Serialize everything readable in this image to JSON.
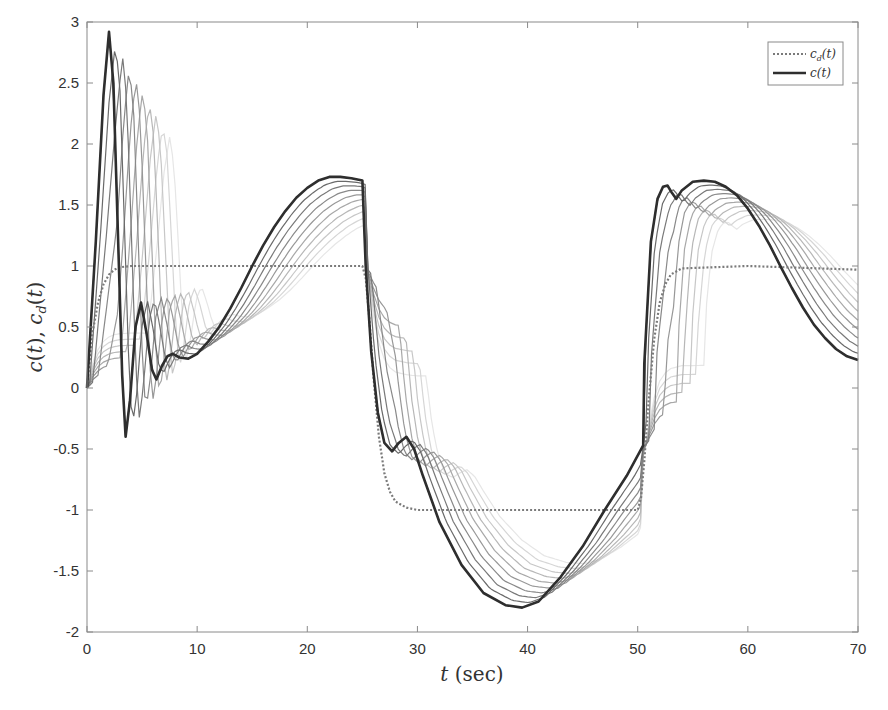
{
  "chart_data": {
    "type": "line",
    "title": "",
    "xlabel": "t (sec)",
    "ylabel": "c(t), c_d(t)",
    "xlim": [
      0,
      70
    ],
    "ylim": [
      -2,
      3
    ],
    "xticks": [
      0,
      10,
      20,
      30,
      40,
      50,
      60,
      70
    ],
    "xtick_labels": [
      "0",
      "10",
      "20",
      "30",
      "40",
      "50",
      "60",
      "70"
    ],
    "yticks": [
      -2,
      -1.5,
      -1,
      -0.5,
      0,
      0.5,
      1,
      1.5,
      2,
      2.5,
      3
    ],
    "ytick_labels": [
      "-2",
      "-1.5",
      "-1",
      "-0.5",
      "0",
      "0.5",
      "1",
      "1.5",
      "2",
      "2.5",
      "3"
    ],
    "grid": false,
    "legend_position": "upper right",
    "legend": [
      {
        "label": "c_d(t)",
        "style": "dotted",
        "color": "#777777"
      },
      {
        "label": "c(t)",
        "style": "solid",
        "color": "#333333"
      }
    ],
    "note": "Multiple lighter gray curves show earlier iterations converging to the dark c(t) curve.",
    "series": [
      {
        "name": "c_d(t)",
        "style": "dotted",
        "color": "#7a7a7a",
        "x": [
          0,
          0.5,
          1,
          1.5,
          2,
          2.5,
          3,
          4,
          10,
          20,
          25,
          25.3,
          25.6,
          26,
          26.5,
          27,
          27.5,
          28,
          29,
          30,
          35,
          40,
          45,
          50,
          50.3,
          50.6,
          51,
          51.5,
          52,
          52.5,
          53,
          54,
          60,
          70
        ],
        "y": [
          0,
          0.45,
          0.7,
          0.85,
          0.93,
          0.97,
          0.99,
          1.0,
          1.0,
          1.0,
          1.0,
          0.9,
          0.6,
          0.1,
          -0.4,
          -0.7,
          -0.85,
          -0.93,
          -0.98,
          -1.0,
          -1.0,
          -1.0,
          -1.0,
          -1.0,
          -0.9,
          -0.6,
          -0.1,
          0.4,
          0.7,
          0.85,
          0.93,
          0.98,
          1.0,
          0.97
        ]
      },
      {
        "name": "c(t)",
        "style": "solid",
        "color": "#2e2e2e",
        "x": [
          0,
          0.8,
          1.5,
          2.0,
          2.4,
          2.8,
          3.2,
          3.5,
          3.9,
          4.4,
          4.9,
          5.4,
          5.9,
          6.3,
          6.8,
          7.3,
          7.8,
          8.4,
          9.2,
          10,
          11,
          12,
          13,
          14,
          15,
          16,
          17,
          18,
          19,
          20,
          21,
          22,
          23,
          24,
          25,
          25.3,
          25.8,
          26.4,
          27,
          27.7,
          28.3,
          29,
          29.7,
          30.5,
          32,
          34,
          36,
          38,
          39.5,
          41,
          43,
          45,
          47,
          49,
          50.5,
          50.6,
          51.2,
          51.8,
          52.3,
          52.7,
          53.1,
          53.5,
          54,
          55,
          56,
          57,
          58,
          59,
          60,
          61,
          62,
          63,
          64,
          65,
          66,
          67,
          68,
          69,
          70
        ],
        "y": [
          0,
          1.2,
          2.4,
          2.92,
          2.5,
          1.3,
          0.1,
          -0.4,
          -0.1,
          0.5,
          0.7,
          0.45,
          0.15,
          0.07,
          0.18,
          0.26,
          0.28,
          0.25,
          0.24,
          0.28,
          0.38,
          0.5,
          0.65,
          0.82,
          1.0,
          1.17,
          1.32,
          1.45,
          1.56,
          1.64,
          1.7,
          1.73,
          1.73,
          1.72,
          1.7,
          1.0,
          0.3,
          -0.2,
          -0.45,
          -0.52,
          -0.45,
          -0.4,
          -0.5,
          -0.72,
          -1.1,
          -1.45,
          -1.68,
          -1.78,
          -1.8,
          -1.75,
          -1.55,
          -1.3,
          -1.0,
          -0.72,
          -0.47,
          0.2,
          1.2,
          1.55,
          1.65,
          1.66,
          1.6,
          1.55,
          1.62,
          1.69,
          1.7,
          1.69,
          1.65,
          1.58,
          1.47,
          1.33,
          1.17,
          0.99,
          0.82,
          0.66,
          0.52,
          0.41,
          0.32,
          0.26,
          0.23
        ]
      }
    ],
    "ghost_iterations": {
      "count": 10,
      "color_range": [
        "#e6e6e6",
        "#555555"
      ],
      "description": "earlier iterations shown in progressively lighter gray, lagging and smoother"
    }
  }
}
